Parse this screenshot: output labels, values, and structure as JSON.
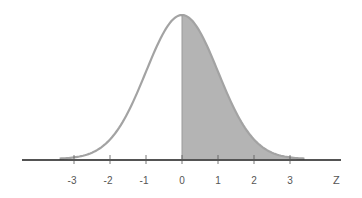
{
  "chart_data": {
    "type": "area",
    "title": "",
    "subtitle": "",
    "xlabel": "Z",
    "ylabel": "",
    "xlim": [
      -3.4,
      3.4
    ],
    "xticks": [
      -3,
      -2,
      -1,
      0,
      1,
      2,
      3
    ],
    "xtick_labels": [
      "-3",
      "-2",
      "-1",
      "0",
      "1",
      "2",
      "3"
    ],
    "grid": false,
    "legend": null,
    "series": [
      {
        "name": "standard normal density",
        "function": "pdf(z) = exp(-z^2/2)/sqrt(2*pi)",
        "x": [
          -3.4,
          -3,
          -2.5,
          -2,
          -1.5,
          -1,
          -0.5,
          0,
          0.5,
          1,
          1.5,
          2,
          2.5,
          3,
          3.4
        ],
        "values": [
          0.0012,
          0.0044,
          0.0175,
          0.054,
          0.1295,
          0.242,
          0.3521,
          0.3989,
          0.3521,
          0.242,
          0.1295,
          0.054,
          0.0175,
          0.0044,
          0.0012
        ]
      }
    ],
    "shaded_region": {
      "from": 0,
      "to": 3.4,
      "color": "#b4b4b4"
    },
    "colors": {
      "curve": "#a3a3a3",
      "fill": "#b4b4b4",
      "axis": "#1a1a1a",
      "label": "#555555"
    }
  }
}
